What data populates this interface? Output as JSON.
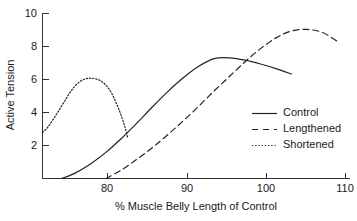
{
  "chart_data": {
    "type": "line",
    "title": "",
    "xlabel": "% Muscle Belly Length of Control",
    "ylabel": "Active Tension",
    "xlim": [
      71.8,
      111.5
    ],
    "ylim": [
      0,
      10.8
    ],
    "grid": false,
    "legend_position": "middle-right",
    "x_ticks": [
      80,
      90,
      100,
      110
    ],
    "x_tick_labels": [
      "80",
      "90",
      "100",
      "110"
    ],
    "y_ticks": [
      2,
      4,
      6,
      8,
      10
    ],
    "y_tick_labels": [
      "2",
      "4",
      "6",
      "8",
      "10"
    ],
    "series": [
      {
        "name": "Control",
        "style": "solid",
        "x": [
          74.3,
          76.0,
          78.0,
          80.0,
          82.0,
          84.0,
          86.0,
          88.0,
          90.0,
          92.0,
          94.0,
          96.0,
          98.0,
          100.0,
          102.0,
          104.0
        ],
        "y": [
          0.0,
          0.35,
          0.95,
          1.7,
          2.6,
          3.6,
          4.65,
          5.65,
          6.55,
          7.3,
          7.8,
          7.85,
          7.7,
          7.45,
          7.15,
          6.8
        ]
      },
      {
        "name": "Lengthened",
        "style": "dashed",
        "x": [
          80.0,
          82.0,
          84.0,
          86.0,
          88.0,
          90.0,
          92.0,
          94.0,
          96.0,
          98.0,
          100.0,
          102.0,
          104.0,
          106.0,
          108.0,
          110.0
        ],
        "y": [
          0.0,
          0.55,
          1.25,
          2.0,
          2.85,
          3.75,
          4.7,
          5.7,
          6.65,
          7.6,
          8.45,
          9.15,
          9.6,
          9.7,
          9.5,
          8.9
        ]
      },
      {
        "name": "Shortened",
        "style": "dotted",
        "x": [
          71.8,
          72.5,
          73.5,
          74.5,
          75.5,
          76.5,
          77.5,
          78.5,
          79.5,
          80.5,
          81.3,
          81.9,
          82.4,
          82.8
        ],
        "y": [
          3.0,
          3.35,
          4.1,
          4.9,
          5.7,
          6.25,
          6.5,
          6.5,
          6.3,
          5.75,
          4.95,
          4.2,
          3.45,
          2.7
        ]
      }
    ]
  },
  "legend": {
    "entries": [
      {
        "label": "Control",
        "style": "solid"
      },
      {
        "label": "Lengthened",
        "style": "dashed"
      },
      {
        "label": "Shortened",
        "style": "dotted"
      }
    ]
  },
  "colors": {
    "axis": "#333333",
    "line": "#222222",
    "background": "#ffffff",
    "text": "#1a1a1a"
  }
}
